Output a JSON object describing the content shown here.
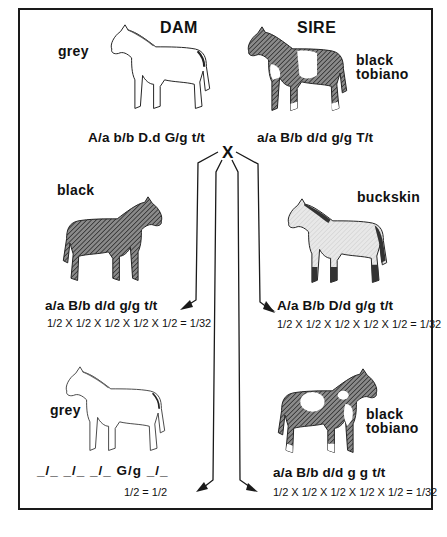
{
  "cross_symbol": "X",
  "parents": {
    "dam": {
      "role": "DAM",
      "color": "grey",
      "genotype": "A/a b/b D.d G/g t/t",
      "horse_shade": "#ffffff",
      "icon": "horse-outline-icon"
    },
    "sire": {
      "role": "SIRE",
      "color_line1": "black",
      "color_line2": "tobiano",
      "genotype": "a/a B/b d/d g/g T/t",
      "horse_shade": "#6e6e6e",
      "icon": "horse-spotted-icon"
    }
  },
  "offspring": [
    {
      "id": "black",
      "color": "black",
      "genotype": "a/a B/b d/d g/g t/t",
      "probability": "1/2 X 1/2 X 1/2 X 1/2 X 1/2 = 1/32",
      "horse_shade": "#6a6a6a"
    },
    {
      "id": "buckskin",
      "color": "buckskin",
      "genotype": "A/a B/b D/d g/g t/t",
      "probability": "1/2 X 1/2 X 1/2 X 1/2 X 1/2 = 1/32",
      "horse_shade": "#e4e4e4"
    },
    {
      "id": "grey",
      "color": "grey",
      "genotype": "_/_ _/_ _/_ G/g _/_",
      "probability": "1/2 = 1/2",
      "horse_shade": "#ffffff"
    },
    {
      "id": "black-tobiano",
      "color_line1": "black",
      "color_line2": "tobiano",
      "genotype": "a/a B/b d/d g g t/t",
      "probability": "1/2 X 1/2 X 1/2 X 1/2 X 1/2 = 1/32",
      "horse_shade": "#5e5e5e"
    }
  ],
  "fractions": {
    "half_num": "1",
    "half_den": "2",
    "result_den": "32",
    "times": "X",
    "equals": "="
  },
  "colors": {
    "ink": "#111111",
    "paper": "#ffffff",
    "frame": "#1a1a1a"
  }
}
